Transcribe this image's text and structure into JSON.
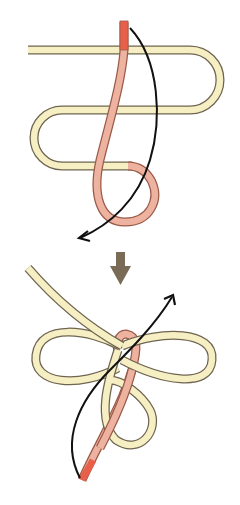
{
  "diagram": {
    "title": "Knot tying steps",
    "colors": {
      "background": "#ffffff",
      "rope_standing": "#f7efc4",
      "rope_standing_outline": "#6e6450",
      "rope_working": "#eeb3a0",
      "rope_working_outline": "#9a5a48",
      "rope_end": "#e8604a",
      "motion_arrow": "#111111",
      "step_arrow": "#7a6b57"
    },
    "steps": [
      {
        "label": "Step 1",
        "description": "Working end passes down through the S-shaped bights and forms a loop; arrow shows direction of pull"
      },
      {
        "label": "Step 2",
        "description": "Resulting three-loop knot; arrow shows working end pulled up through the loops"
      }
    ],
    "transition_icon": "down-arrow-icon"
  }
}
